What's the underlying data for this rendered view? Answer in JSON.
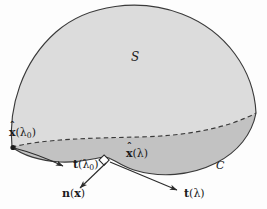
{
  "figure": {
    "colors": {
      "background": "#fdfdfd",
      "surface_upper_fill": "#dcdcdc",
      "surface_lower_fill": "#c2c2c2",
      "outline": "#3a3a3a",
      "dashed_curve": "#3a3a3a",
      "label_text": "#1b1b1b",
      "arrow": "#2b2b2b"
    },
    "labels": {
      "surface": "S",
      "curve": "C",
      "point_lambda0_base": "x",
      "point_lambda0_arg": "(λ",
      "point_lambda0_sub": "0",
      "point_lambda0_close": ")",
      "point_lambda_base": "x",
      "point_lambda_arg": "(λ)",
      "tangent_lambda0_base": "t",
      "tangent_lambda0_arg": "(λ",
      "tangent_lambda0_sub": "0",
      "tangent_lambda0_close": ")",
      "tangent_lambda_base": "t",
      "tangent_lambda_arg": "(λ)",
      "normal_base": "n",
      "normal_open": "(",
      "normal_arg": "x",
      "normal_close": ")",
      "hat_glyph": "ˆ"
    },
    "annotations": {
      "right_angle_marker": "right-angle-square",
      "vertex_dot": "endpoint-dot"
    }
  }
}
